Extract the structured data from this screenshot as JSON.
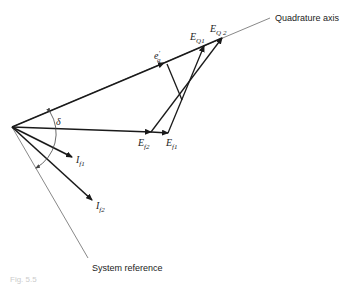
{
  "diagram": {
    "type": "phasor-diagram",
    "labels": {
      "quadrature_axis": "Quadrature axis",
      "system_reference": "System reference",
      "delta": "δ",
      "eq_prime": {
        "main": "e",
        "sub": "q",
        "sup": "′"
      },
      "EQ1": {
        "main": "E",
        "sub": "Q1"
      },
      "EQ2": {
        "main": "E",
        "sub": "Q 2"
      },
      "Ef1": {
        "main": "E",
        "sub": "f1"
      },
      "Ef2": {
        "main": "E",
        "sub": "f2"
      },
      "If1": {
        "main": "I",
        "sub": "f1"
      },
      "If2": {
        "main": "I",
        "sub": "f2"
      },
      "caption": "Fig. 5.5"
    },
    "colors": {
      "line": "#1a1a1a",
      "thin_line": "#555555",
      "background": "#ffffff"
    }
  }
}
